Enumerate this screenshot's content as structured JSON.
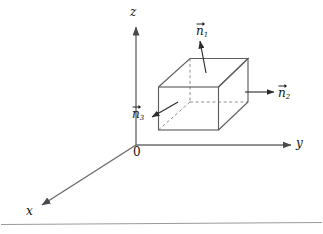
{
  "figure": {
    "kind": "3d-coordinate-axes-with-rectangular-box",
    "background_color": "#ffffff",
    "stroke_color": "#555555",
    "text_color": "#111111",
    "axes": {
      "origin_label": "0",
      "z_label": "z",
      "y_label": "y",
      "x_label": "x"
    },
    "vectors": [
      {
        "id": "n1",
        "glyph": "n",
        "subscript": "1",
        "label": "n⃗1",
        "direction": "up",
        "points_to": "top-face"
      },
      {
        "id": "n2",
        "glyph": "n",
        "subscript": "2",
        "label": "n⃗2",
        "direction": "right",
        "points_to": "right-face"
      },
      {
        "id": "n3",
        "glyph": "n",
        "subscript": "3",
        "label": "n⃗3",
        "direction": "down-left",
        "points_to": "bottom-face"
      }
    ],
    "box": {
      "name": "rectangular-box",
      "hidden_edges_style": "dashed",
      "visible_edges_style": "solid"
    },
    "footer_rule": "horizontal-rule"
  }
}
